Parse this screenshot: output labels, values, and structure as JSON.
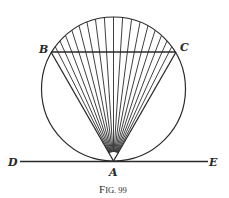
{
  "figure": {
    "caption": "Fig. 99",
    "caption_parts": {
      "first": "F",
      "rest": "IG. 99"
    },
    "stroke_color": "#2a2a2a",
    "circle": {
      "cx": 113.5,
      "cy": 89,
      "r": 72
    },
    "points": {
      "A": {
        "label": "A",
        "x": 113.5,
        "y": 161
      },
      "B": {
        "label": "B",
        "x": 51,
        "y": 52
      },
      "C": {
        "label": "C",
        "x": 176,
        "y": 52
      },
      "D": {
        "label": "D",
        "x": 20,
        "y": 161.5
      },
      "E": {
        "label": "E",
        "x": 208,
        "y": 161.5
      }
    },
    "fan_line_count": 19
  }
}
